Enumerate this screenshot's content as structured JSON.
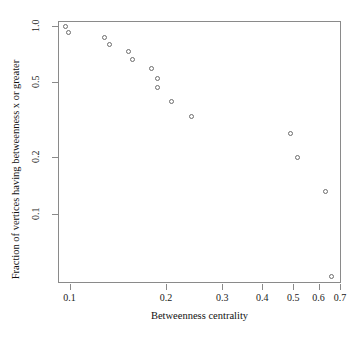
{
  "chart_data": {
    "type": "scatter",
    "title": "",
    "xlabel": "Betweenness centrality",
    "ylabel": "Fraction of vertices having betweenness x or greater",
    "xscale": "log",
    "yscale": "log",
    "xlim": [
      0.092,
      0.705
    ],
    "ylim": [
      0.043,
      1.06
    ],
    "grid": false,
    "legend": null,
    "xticks": [
      {
        "value": 0.1,
        "label": "0.1"
      },
      {
        "value": 0.2,
        "label": "0.2"
      },
      {
        "value": 0.3,
        "label": "0.3"
      },
      {
        "value": 0.4,
        "label": "0.4"
      },
      {
        "value": 0.5,
        "label": "0.5"
      },
      {
        "value": 0.6,
        "label": "0.6"
      },
      {
        "value": 0.7,
        "label": "0.7"
      }
    ],
    "yticks": [
      {
        "value": 1.0,
        "label": "1.0"
      },
      {
        "value": 0.5,
        "label": "0.5"
      },
      {
        "value": 0.2,
        "label": "0.2"
      },
      {
        "value": 0.1,
        "label": "0.1"
      }
    ],
    "points": [
      {
        "x": 0.097,
        "y": 1.0
      },
      {
        "x": 0.099,
        "y": 0.93
      },
      {
        "x": 0.128,
        "y": 0.87
      },
      {
        "x": 0.133,
        "y": 0.8
      },
      {
        "x": 0.152,
        "y": 0.73
      },
      {
        "x": 0.157,
        "y": 0.67
      },
      {
        "x": 0.18,
        "y": 0.6
      },
      {
        "x": 0.187,
        "y": 0.53
      },
      {
        "x": 0.188,
        "y": 0.47
      },
      {
        "x": 0.208,
        "y": 0.4
      },
      {
        "x": 0.24,
        "y": 0.33
      },
      {
        "x": 0.487,
        "y": 0.27
      },
      {
        "x": 0.513,
        "y": 0.2
      },
      {
        "x": 0.627,
        "y": 0.133
      },
      {
        "x": 0.655,
        "y": 0.047
      }
    ],
    "marker": {
      "shape": "circle-open",
      "color": "#6d6d6d",
      "size": 5
    }
  },
  "style": {
    "background": "#ffffff",
    "axis_color": "#8a8a8a",
    "text_color": "#101010"
  }
}
